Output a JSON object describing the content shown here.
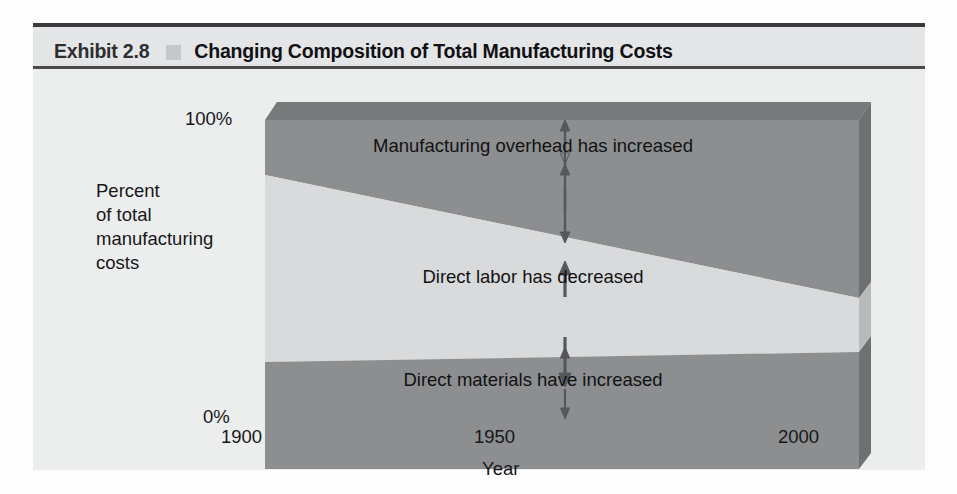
{
  "exhibit": {
    "label": "Exhibit 2.8",
    "bullet_icon": "square-bullet-icon",
    "title": "Changing Composition of Total Manufacturing Costs",
    "frame_color": "#3a3a3c",
    "body_color": "#eceded"
  },
  "chart_data": {
    "type": "area",
    "title": "Changing Composition of Total Manufacturing Costs",
    "subtitle": "",
    "xlabel": "Year",
    "ylabel": "Percent of total manufacturing costs",
    "ylabel_lines": [
      "Percent",
      "of total",
      "manufacturing",
      "costs"
    ],
    "x": [
      1900,
      1950,
      2000
    ],
    "xlim": [
      1900,
      2000
    ],
    "ylim": [
      0,
      100
    ],
    "xtick_labels": [
      "1900",
      "1950",
      "2000"
    ],
    "ytick_labels": [
      "100%",
      "0%"
    ],
    "yticks": [
      100,
      0
    ],
    "grid": false,
    "legend": "none",
    "stacked": true,
    "style": "3d-stacked-area",
    "series": [
      {
        "name": "Manufacturing overhead",
        "annotation": "Manufacturing overhead has increased",
        "color": "#8c8e90",
        "values": [
          18,
          27,
          45
        ],
        "boundary_top": [
          100,
          100,
          100
        ],
        "boundary_bottom": [
          82,
          73,
          55
        ]
      },
      {
        "name": "Direct labor",
        "annotation": "Direct labor has decreased",
        "color": "#d9dadb",
        "values": [
          62,
          44,
          12
        ],
        "boundary_top": [
          82,
          73,
          55
        ],
        "boundary_bottom": [
          20,
          29,
          43
        ]
      },
      {
        "name": "Direct materials",
        "annotation": "Direct materials have increased",
        "color": "#8c8e90",
        "values": [
          20,
          29,
          43
        ],
        "boundary_top": [
          20,
          29,
          43
        ],
        "boundary_bottom": [
          0,
          0,
          0
        ]
      }
    ],
    "annotations": [
      {
        "text": "Manufacturing overhead has increased",
        "arrow": "double-headed-vertical-arrow",
        "at_x": 1950,
        "band": "Manufacturing overhead"
      },
      {
        "text": "Direct labor has decreased",
        "arrow": "double-headed-vertical-arrow",
        "at_x": 1950,
        "band": "Direct labor"
      },
      {
        "text": "Direct materials have increased",
        "arrow": "double-headed-vertical-arrow",
        "at_x": 1950,
        "band": "Direct materials"
      }
    ],
    "colors": {
      "overhead": "#8c8e90",
      "labor": "#d9dadb",
      "materials": "#8c8e90",
      "top_face": "#77797b",
      "side_face": "#6e7072",
      "side_face_light": "#b9babb",
      "arrow": "#5c5e60"
    }
  }
}
